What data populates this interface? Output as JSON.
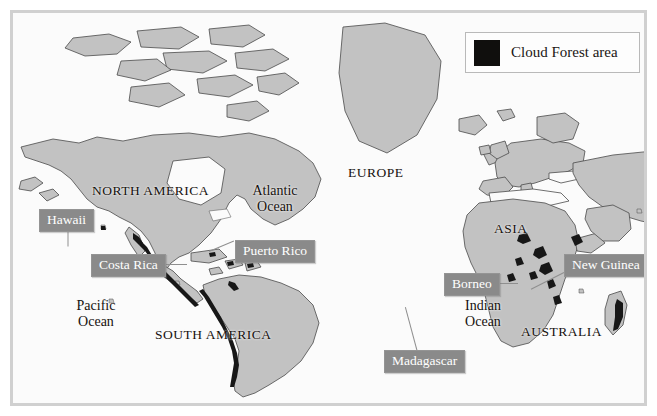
{
  "map": {
    "title": "World map of cloud forest areas",
    "colors": {
      "ocean": "#fbfbfb",
      "land": "#c2c2c2",
      "land_outline": "#4a4a4a",
      "cloud_forest": "#171717",
      "callout_bg": "#8a8a8a",
      "callout_text": "#ffffff",
      "frame": "#d0d0d0",
      "label_text": "#16110e"
    }
  },
  "legend": {
    "swatch_color": "#100f0d",
    "label": "Cloud Forest area"
  },
  "region_labels": [
    {
      "id": "north-america",
      "text": "NORTH AMERICA",
      "style": "caps",
      "x": 85,
      "y": 172
    },
    {
      "id": "south-america",
      "text": "SOUTH AMERICA",
      "style": "caps",
      "x": 148,
      "y": 318
    },
    {
      "id": "europe",
      "text": "EUROPE",
      "style": "caps",
      "x": 341,
      "y": 154
    },
    {
      "id": "asia",
      "text": "ASIA",
      "style": "caps",
      "x": 487,
      "y": 210
    },
    {
      "id": "australia",
      "text": "AUSTRALIA",
      "style": "caps",
      "x": 514,
      "y": 313
    },
    {
      "id": "atlantic-ocean",
      "text": "Atlantic\nOcean",
      "style": "ocean",
      "x": 232,
      "y": 173
    },
    {
      "id": "pacific-ocean",
      "text": "Pacific\nOcean",
      "style": "ocean",
      "x": 56,
      "y": 288
    },
    {
      "id": "indian-ocean",
      "text": "Indian\nOcean",
      "style": "ocean",
      "x": 444,
      "y": 288
    }
  ],
  "callouts": [
    {
      "id": "hawaii",
      "text": "Hawaii",
      "x": 26,
      "y": 196,
      "leader": {
        "x": 55,
        "y": 214,
        "len": 19,
        "angle": 90
      }
    },
    {
      "id": "costa-rica",
      "text": "Costa Rica",
      "x": 78,
      "y": 241,
      "leader": {
        "x": 148,
        "y": 251,
        "len": 26,
        "angle": 0
      }
    },
    {
      "id": "puerto-rico",
      "text": "Puerto Rico",
      "x": 222,
      "y": 227,
      "leader": {
        "x": 196,
        "y": 238,
        "len": 27,
        "angle": -23
      }
    },
    {
      "id": "madagascar",
      "text": "Madagascar",
      "x": 371,
      "y": 337,
      "leader": {
        "x": 404,
        "y": 337,
        "len": 45,
        "angle": -105
      }
    },
    {
      "id": "borneo",
      "text": "Borneo",
      "x": 431,
      "y": 260,
      "leader": {
        "x": 481,
        "y": 270,
        "len": 24,
        "angle": 0
      }
    },
    {
      "id": "new-guinea",
      "text": "New Guinea",
      "x": 551,
      "y": 241,
      "leader": {
        "x": 551,
        "y": 259,
        "len": 37,
        "angle": 153
      }
    }
  ]
}
